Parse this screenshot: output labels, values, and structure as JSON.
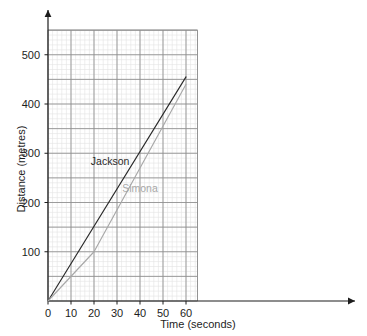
{
  "chart_data": {
    "type": "line",
    "title": "",
    "xlabel": "Time (seconds)",
    "ylabel": "Distance (metres)",
    "xlim": [
      0,
      65
    ],
    "ylim": [
      0,
      550
    ],
    "xticks": [
      0,
      10,
      20,
      30,
      40,
      50,
      60
    ],
    "yticks": [
      100,
      200,
      300,
      400,
      500
    ],
    "xtick_labels": [
      "0",
      "10",
      "20",
      "30",
      "40",
      "50",
      "60"
    ],
    "ytick_labels": [
      "100",
      "200",
      "300",
      "400",
      "500"
    ],
    "grid": true,
    "grid_major_x": 10,
    "grid_major_y": 50,
    "grid_minor_x": 2,
    "grid_minor_y": 10,
    "legend": "inline-labels",
    "series": [
      {
        "name": "Jackson",
        "color": "#2b2b2b",
        "x": [
          0,
          60
        ],
        "y": [
          0,
          455
        ],
        "label_x": 27,
        "label_y": 277
      },
      {
        "name": "Simona",
        "color": "#a8a8a8",
        "x": [
          0,
          20,
          60
        ],
        "y": [
          0,
          100,
          440
        ],
        "label_x": 40,
        "label_y": 222
      }
    ]
  },
  "axes": {
    "x_axis_name": "time-axis",
    "y_axis_name": "distance-axis",
    "origin_label": "0"
  },
  "colors": {
    "background": "#ffffff",
    "axis": "#1d1d1d",
    "grid_major": "#8d8d8d",
    "grid_minor": "#e2e2e2",
    "text": "#1d1d1d",
    "jackson": "#2b2b2b",
    "simona": "#a8a8a8"
  }
}
